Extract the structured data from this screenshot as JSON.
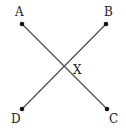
{
  "diagram": {
    "points": [
      {
        "id": "A",
        "label": "A",
        "x": 22,
        "y": 24,
        "lx": 20,
        "ly": 14
      },
      {
        "id": "B",
        "label": "B",
        "x": 106,
        "y": 24,
        "lx": 108,
        "ly": 14
      },
      {
        "id": "C",
        "label": "C",
        "x": 107,
        "y": 109,
        "lx": 113,
        "ly": 123
      },
      {
        "id": "D",
        "label": "D",
        "x": 22,
        "y": 109,
        "lx": 15,
        "ly": 123
      }
    ],
    "segments": [
      {
        "from": "A",
        "to": "C"
      },
      {
        "from": "B",
        "to": "D"
      }
    ],
    "intersection": {
      "label": "X",
      "x": 65,
      "y": 67,
      "lx": 77,
      "ly": 74
    },
    "colors": {
      "line": "#444444",
      "point": "#111111",
      "text": "#222222"
    }
  }
}
